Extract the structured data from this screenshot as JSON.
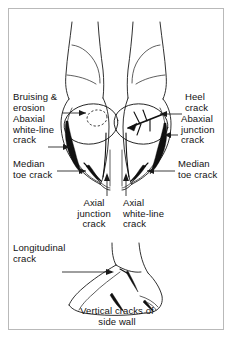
{
  "figure": {
    "title": "Vertical cracks of side wall",
    "background_color": "#ffffff",
    "ink_color": "#1a1a1a",
    "frame_color": "#b9b9b9",
    "panels": {
      "top": {
        "name": "bovine-claws-dorsal-view",
        "description": "Dorsal view of bovine digit showing two claws with heel bulbs"
      },
      "bottom": {
        "name": "hoof-side-wall-view",
        "description": "Lateral view of hoof side wall"
      }
    },
    "labels": {
      "bruising_erosion": "Bruising &\nerosion",
      "abaxial_white_line_crack": "Abaxial\nwhite-line\ncrack",
      "median_toe_crack_left": "Median\ntoe crack",
      "heel_crack": "Heel\ncrack",
      "abaxial_junction_crack": "Abaxial\njunction\ncrack",
      "median_toe_crack_right": "Median\ntoe crack",
      "axial_junction_crack": "Axial\njunction\ncrack",
      "axial_white_line_crack": "Axial\nwhite-line\ncrack",
      "longitudinal_crack": "Longitudinal\ncrack",
      "caption": "Vertical cracks of\nside wall"
    }
  }
}
